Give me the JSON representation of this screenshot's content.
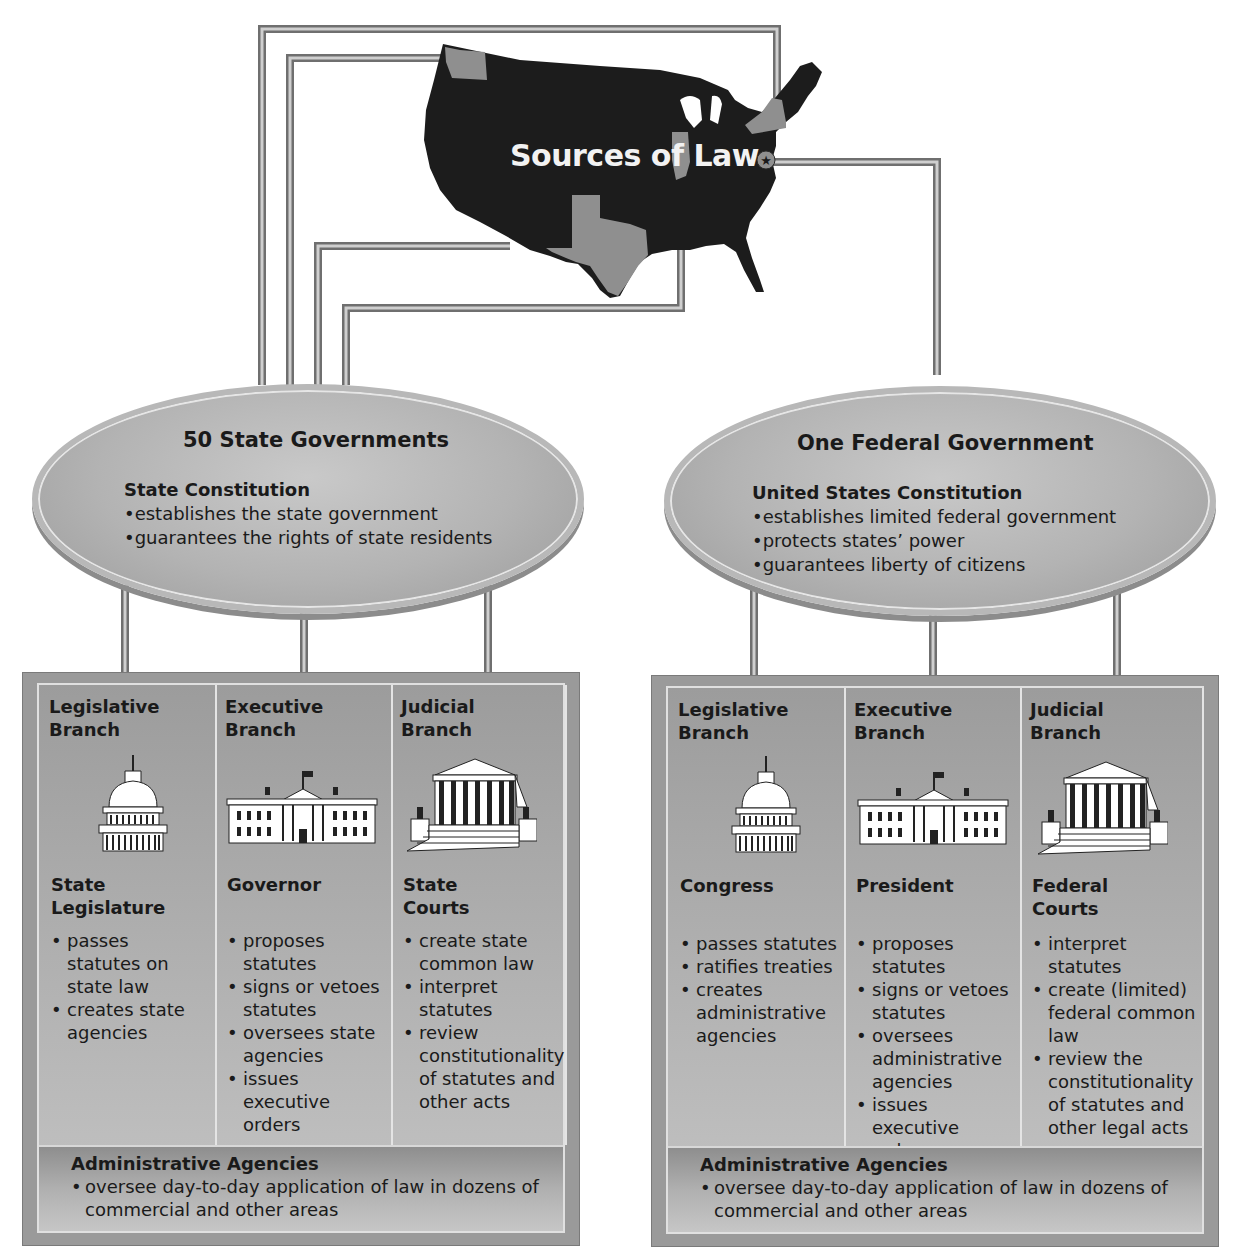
{
  "map": {
    "title": "Sources of Law",
    "colors": {
      "land": "#1c1c1c",
      "highlighted_state": "#8f8f8f",
      "wire": "#7a7a7a"
    }
  },
  "state": {
    "title": "50 State Governments",
    "constitution": "State Constitution",
    "constitution_points": [
      "establishes the state government",
      "guarantees the rights of state residents"
    ],
    "branches": [
      {
        "heading_line1": "Legislative",
        "heading_line2": "Branch",
        "icon": "capitol-dome-icon",
        "office_line1": "State",
        "office_line2": "Legislature",
        "points": [
          "passes statutes on state law",
          "creates state agencies"
        ]
      },
      {
        "heading_line1": "Executive",
        "heading_line2": "Branch",
        "icon": "white-house-icon",
        "office_line1": "Governor",
        "office_line2": "",
        "points": [
          "proposes statutes",
          "signs or vetoes statutes",
          "oversees state agencies",
          "issues executive orders"
        ]
      },
      {
        "heading_line1": "Judicial",
        "heading_line2": "Branch",
        "icon": "courthouse-icon",
        "office_line1": "State",
        "office_line2": "Courts",
        "points": [
          "create state common law",
          "interpret statutes",
          "review constitutionality of statutes and other acts"
        ]
      }
    ],
    "agencies": {
      "title": "Administrative Agencies",
      "points": [
        "oversee day-to-day application of law in dozens of commercial and other areas"
      ]
    }
  },
  "federal": {
    "title": "One Federal Government",
    "constitution": "United States Constitution",
    "constitution_points": [
      "establishes limited federal government",
      "protects states’ power",
      "guarantees liberty of citizens"
    ],
    "branches": [
      {
        "heading_line1": "Legislative",
        "heading_line2": "Branch",
        "icon": "capitol-dome-icon",
        "office_line1": "Congress",
        "office_line2": "",
        "points": [
          "passes statutes",
          "ratifies treaties",
          "creates administrative agencies"
        ]
      },
      {
        "heading_line1": "Executive",
        "heading_line2": "Branch",
        "icon": "white-house-icon",
        "office_line1": "President",
        "office_line2": "",
        "points": [
          "proposes statutes",
          "signs or vetoes statutes",
          "oversees administrative agencies",
          "issues executive orders"
        ]
      },
      {
        "heading_line1": "Judicial",
        "heading_line2": "Branch",
        "icon": "courthouse-icon",
        "office_line1": "Federal",
        "office_line2": "Courts",
        "points": [
          "interpret statutes",
          "create (limited) federal common law",
          "review the constitutionality of statutes and other legal acts"
        ]
      }
    ],
    "agencies": {
      "title": "Administrative Agencies",
      "points": [
        "oversee day-to-day application of law in dozens of commercial and other areas"
      ]
    }
  }
}
